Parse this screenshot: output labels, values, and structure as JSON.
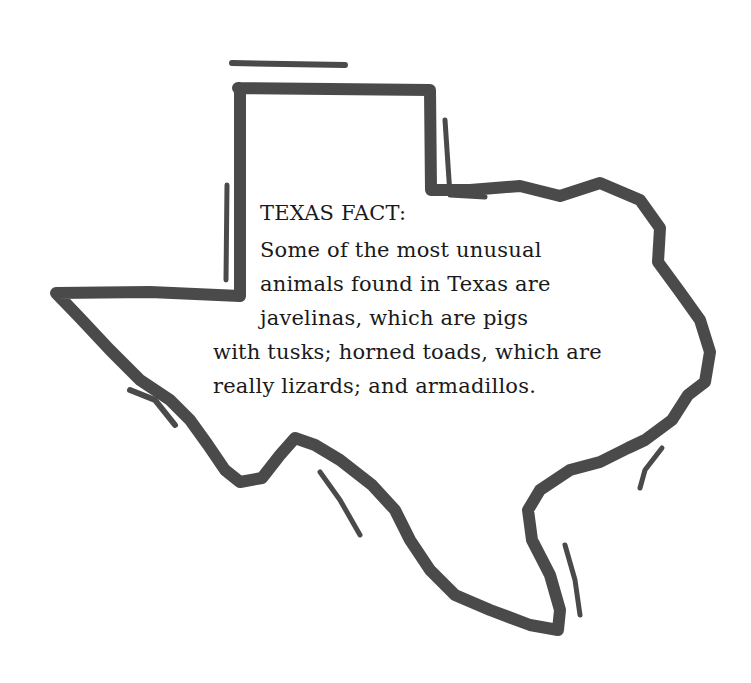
{
  "fact": {
    "heading": "TEXAS FACT:",
    "lines": [
      "Some of the most unusual",
      "animals found in Texas are",
      "javelinas, which are pigs",
      "with tusks; horned toads, which are",
      "really lizards; and armadillos."
    ]
  },
  "colors": {
    "outline": "#4a4a4a",
    "text": "#1a1a1a",
    "background": "#ffffff"
  }
}
